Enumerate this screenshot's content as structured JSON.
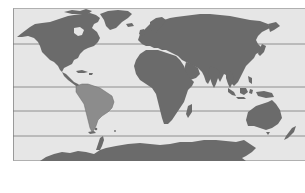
{
  "map": {
    "type": "world-political-outline",
    "projection": "mercator-like",
    "style": "grayscale",
    "colors": {
      "ocean": "#e6e6e6",
      "land": "#6b6b6b",
      "highlight_land": "#8c8c8c",
      "latitude_lines": "#7a7a7a",
      "frame_border": "#9a9a9a",
      "background": "#ffffff"
    },
    "highlighted_region": "South America",
    "latitude_lines_count": 5,
    "latitude_lines_y": [
      44,
      87,
      111,
      136,
      8
    ],
    "continents": [
      "North America",
      "South America",
      "Europe",
      "Africa",
      "Asia",
      "Australia",
      "Antarctica",
      "Greenland"
    ]
  }
}
